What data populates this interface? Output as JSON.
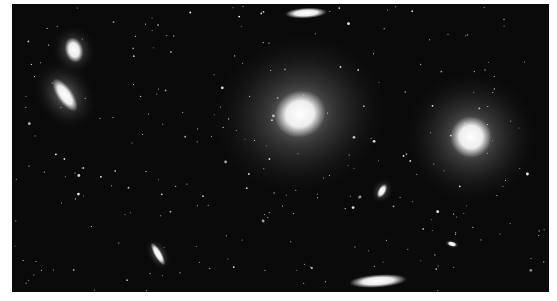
{
  "image": {
    "subject": "galaxy cluster star field",
    "background_color": "#0a0a0a",
    "page_background": "#ffffff",
    "frame": {
      "x": 12,
      "y": 4,
      "width": 537,
      "height": 288
    },
    "galaxies": [
      {
        "name": "giant-elliptical-center",
        "cx": 288,
        "cy": 110,
        "rx": 20,
        "ry": 18,
        "halo": 75,
        "rot": -20
      },
      {
        "name": "giant-elliptical-right",
        "cx": 459,
        "cy": 133,
        "rx": 16,
        "ry": 16,
        "halo": 55,
        "rot": 0
      },
      {
        "name": "elliptical-upper-left",
        "cx": 62,
        "cy": 46,
        "rx": 7,
        "ry": 10,
        "halo": 16,
        "rot": -15
      },
      {
        "name": "lenticular-left",
        "cx": 53,
        "cy": 91,
        "rx": 6,
        "ry": 15,
        "halo": 24,
        "rot": -35
      },
      {
        "name": "edge-on-top",
        "cx": 294,
        "cy": 9,
        "rx": 16,
        "ry": 4,
        "halo": 10,
        "rot": -3
      },
      {
        "name": "edge-on-bottom",
        "cx": 366,
        "cy": 277,
        "rx": 22,
        "ry": 5,
        "halo": 14,
        "rot": -4
      },
      {
        "name": "edge-on-lower-left",
        "cx": 146,
        "cy": 250,
        "rx": 3,
        "ry": 10,
        "halo": 8,
        "rot": -30
      },
      {
        "name": "small-elliptical",
        "cx": 370,
        "cy": 187,
        "rx": 3,
        "ry": 6,
        "halo": 8,
        "rot": 30
      },
      {
        "name": "tiny-galaxy",
        "cx": 440,
        "cy": 240,
        "rx": 4,
        "ry": 2,
        "halo": 5,
        "rot": 15
      }
    ],
    "star_count": 260
  }
}
